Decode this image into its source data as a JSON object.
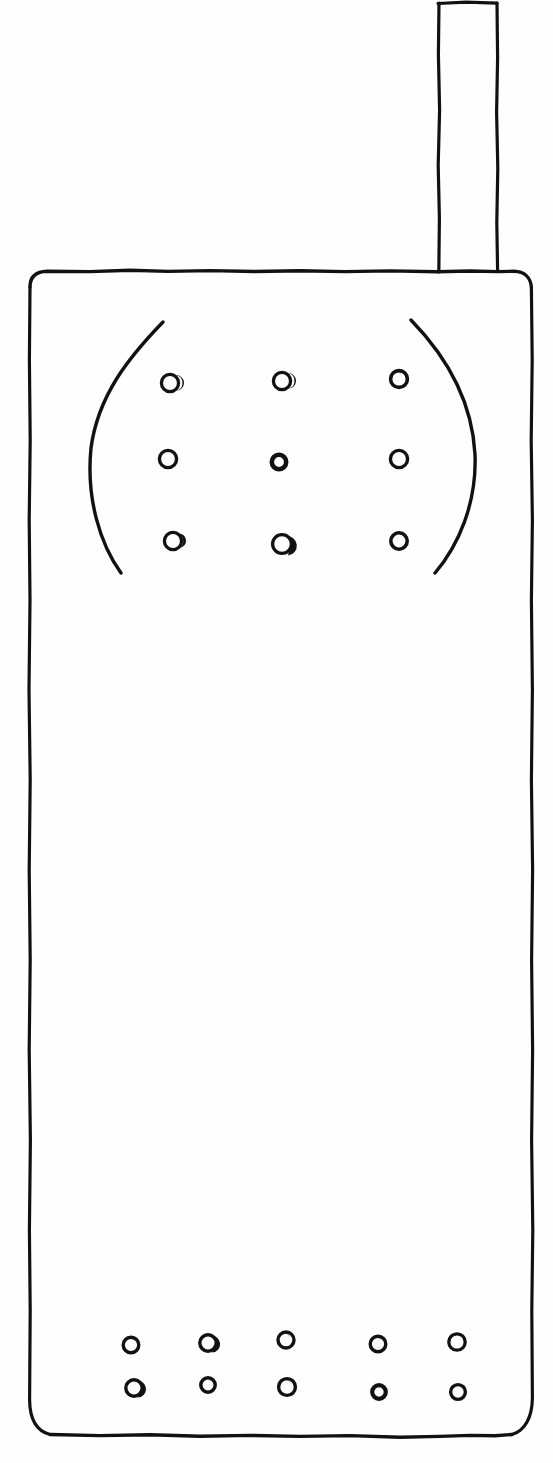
{
  "drawing": {
    "title": "Hand-drawn mobile phone sketch",
    "subject": "mobile-phone",
    "style": "pen-and-ink line drawing",
    "background_color": "#fefefe",
    "ink_color": "#111111",
    "canvas": {
      "width": 553,
      "height": 1463
    }
  },
  "parts": {
    "antenna": {
      "label": "antenna",
      "x": 437,
      "y": 2,
      "width": 61,
      "height": 270
    },
    "body": {
      "label": "phone body",
      "x": 28,
      "y": 271,
      "width": 505,
      "height": 165,
      "corner_radius": 26,
      "bottom_y": 1436
    },
    "keypad_bracket_left": {
      "label": "left keypad arc",
      "start": [
        163,
        322
      ],
      "control": [
        77,
        448
      ],
      "end": [
        121,
        573
      ]
    },
    "keypad_bracket_right": {
      "label": "right keypad arc",
      "start": [
        411,
        320
      ],
      "control": [
        492,
        462
      ],
      "end": [
        435,
        573
      ]
    },
    "keypad": {
      "label": "keypad dot grid",
      "rows": 3,
      "columns": 3,
      "dot_count": 9,
      "dots": [
        {
          "cx": 171,
          "cy": 383,
          "r": 9
        },
        {
          "cx": 283,
          "cy": 381,
          "r": 9
        },
        {
          "cx": 399,
          "cy": 379,
          "r": 9
        },
        {
          "cx": 169,
          "cy": 459,
          "r": 9
        },
        {
          "cx": 279,
          "cy": 462,
          "r": 8
        },
        {
          "cx": 399,
          "cy": 459,
          "r": 9
        },
        {
          "cx": 174,
          "cy": 541,
          "r": 9
        },
        {
          "cx": 283,
          "cy": 545,
          "r": 9
        },
        {
          "cx": 399,
          "cy": 541,
          "r": 8
        }
      ]
    },
    "bottom_keys": {
      "label": "bottom dot grid",
      "rows": 2,
      "columns": 5,
      "dot_count": 10,
      "dots": [
        {
          "cx": 131,
          "cy": 1345,
          "r": 8
        },
        {
          "cx": 208,
          "cy": 1343,
          "r": 8
        },
        {
          "cx": 286,
          "cy": 1340,
          "r": 8
        },
        {
          "cx": 378,
          "cy": 1344,
          "r": 8
        },
        {
          "cx": 457,
          "cy": 1342,
          "r": 8
        },
        {
          "cx": 134,
          "cy": 1388,
          "r": 8
        },
        {
          "cx": 208,
          "cy": 1385,
          "r": 7
        },
        {
          "cx": 287,
          "cy": 1387,
          "r": 8
        },
        {
          "cx": 379,
          "cy": 1392,
          "r": 7
        },
        {
          "cx": 458,
          "cy": 1392,
          "r": 7
        }
      ]
    }
  }
}
